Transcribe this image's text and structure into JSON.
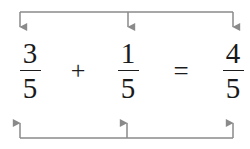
{
  "diagram": {
    "line_color": "#8a8a8a",
    "text_color": "#1a1a1a",
    "background_color": "#ffffff",
    "equation_text": "3/5 + 1/5 = 4/5"
  },
  "terms": [
    {
      "id": "first-addend",
      "numerator": "3",
      "denominator": "5"
    },
    {
      "id": "second-addend",
      "numerator": "1",
      "denominator": "5"
    },
    {
      "id": "sum",
      "numerator": "4",
      "denominator": "5"
    }
  ],
  "operators": {
    "plus": "+",
    "equals": "="
  },
  "annotations": {
    "top_bracket": {
      "name": "numerator-connector-bracket",
      "direction": "down",
      "arrow_count": 3,
      "arrow_x": [
        20,
        128,
        233
      ],
      "rail_y": 12,
      "arrow_tip_y": 35
    },
    "bottom_bracket": {
      "name": "denominator-connector-bracket",
      "direction": "up",
      "arrow_count": 3,
      "arrow_x": [
        20,
        127,
        233
      ],
      "rail_y": 138,
      "arrow_tip_y": 115
    }
  }
}
